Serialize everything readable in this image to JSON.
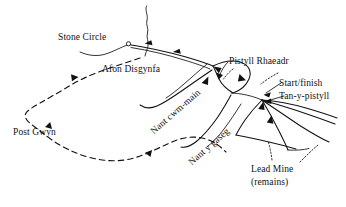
{
  "map": {
    "title": "Pistyll Rhaeadr sketch map",
    "background_color": "#ffffff",
    "ink_color": "#111111",
    "labels": {
      "stone_circle": "Stone Circle",
      "afon_disgynfa": "Afon Disgynfa",
      "nant_cwm_main": "Nant cwm-main",
      "nant_y_gaseg": "Nant y gaseg",
      "pistyll_rhaeadr": "Pistyll Rhaeadr",
      "start_finish": "Start/finish",
      "tan_y_pistyll": "Tan-y-pistyll",
      "post_gwyn": "Post Gwyn",
      "lead_mine": "Lead Mine",
      "lead_mine_sub": "(remains)"
    },
    "features": {
      "stone_circle_marker": "circle-marker",
      "trail_direction_markers": "triangle-arrow",
      "river_direction_markers": "arrowhead",
      "leader_lines": "dotted-leader"
    }
  }
}
